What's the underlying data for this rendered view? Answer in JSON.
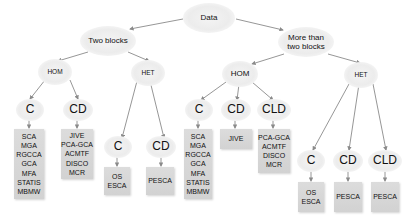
{
  "root": {
    "label": "Data"
  },
  "level1": [
    {
      "label": "Two blocks"
    },
    {
      "label": "More than two blocks",
      "line1": "More than",
      "line2": "two blocks"
    }
  ],
  "two_blocks": {
    "hom": {
      "label": "HOM",
      "children": [
        {
          "label": "C",
          "methods": [
            "SCA",
            "MGA",
            "RGCCA",
            "GCA",
            "MFA",
            "STATIS",
            "MBMW"
          ]
        },
        {
          "label": "CD",
          "methods": [
            "JIVE",
            "PCA-GCA",
            "ACMTF",
            "DISCO",
            "MCR"
          ]
        }
      ]
    },
    "het": {
      "label": "HET",
      "children": [
        {
          "label": "C",
          "methods": [
            "OS",
            "ESCA"
          ]
        },
        {
          "label": "CD",
          "methods": [
            "PESCA"
          ]
        }
      ]
    }
  },
  "more_blocks": {
    "hom": {
      "label": "HOM",
      "children": [
        {
          "label": "C",
          "methods": [
            "SCA",
            "MGA",
            "RGCCA",
            "GCA",
            "MFA",
            "STATIS",
            "MBMW"
          ]
        },
        {
          "label": "CD",
          "methods": [
            "JIVE"
          ]
        },
        {
          "label": "CLD",
          "methods": [
            "PCA-GCA",
            "ACMTF",
            "DISCO",
            "MCR"
          ]
        }
      ]
    },
    "het": {
      "label": "HET",
      "children": [
        {
          "label": "C",
          "methods": [
            "OS",
            "ESCA"
          ]
        },
        {
          "label": "CD",
          "methods": [
            "PESCA"
          ]
        },
        {
          "label": "CLD",
          "methods": [
            "PESCA"
          ]
        }
      ]
    }
  },
  "colors": {
    "node_fill": "#ececec",
    "box_fill": "#d6d6d6",
    "edge": "#8a8a8a"
  }
}
